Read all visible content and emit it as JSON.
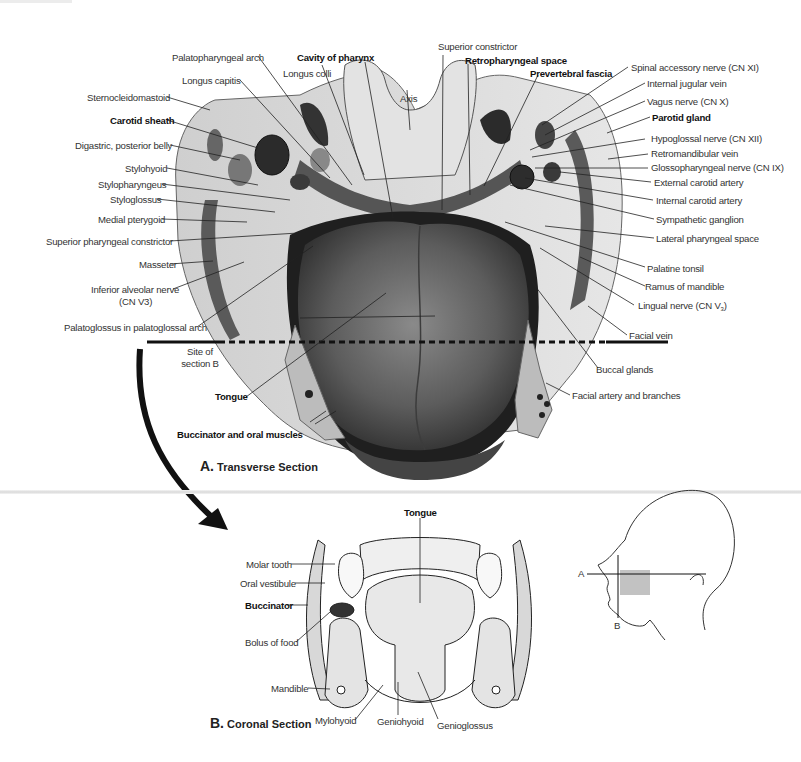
{
  "figure": {
    "section_a": {
      "caption_letter": "A.",
      "caption_text": "Transverse Section",
      "section_line_label_line1": "Site of",
      "section_line_label_line2": "section B",
      "labels_left": [
        {
          "text": "Palatopharyngeal arch",
          "bold": false
        },
        {
          "text": "Longus capitis",
          "bold": false
        },
        {
          "text": "Sternocleidomastoid",
          "bold": false
        },
        {
          "text": "Carotid sheath",
          "bold": true
        },
        {
          "text": "Digastric, posterior belly",
          "bold": false
        },
        {
          "text": "Stylohyoid",
          "bold": false
        },
        {
          "text": "Stylopharyngeus",
          "bold": false
        },
        {
          "text": "Styloglossus",
          "bold": false
        },
        {
          "text": "Medial pterygoid",
          "bold": false
        },
        {
          "text": "Superior pharyngeal constrictor",
          "bold": false
        },
        {
          "text": "Masseter",
          "bold": false
        },
        {
          "text": "Inferior alveolar nerve",
          "bold": false
        },
        {
          "text": "(CN V3)",
          "bold": false
        },
        {
          "text": "Palatoglossus in palatoglossal arch",
          "bold": false
        },
        {
          "text": "Tongue",
          "bold": true
        },
        {
          "text": "Buccinator and oral muscles",
          "bold": true
        }
      ],
      "labels_top": [
        {
          "text": "Cavity of pharynx",
          "bold": true
        },
        {
          "text": "Longus colli",
          "bold": false
        },
        {
          "text": "Axis",
          "bold": false
        },
        {
          "text": "Superior constrictor",
          "bold": false
        },
        {
          "text": "Retropharyngeal space",
          "bold": true
        },
        {
          "text": "Prevertebral fascia",
          "bold": true
        }
      ],
      "labels_right": [
        {
          "text": "Spinal accessory nerve (CN XI)",
          "bold": false
        },
        {
          "text": "Internal jugular vein",
          "bold": false
        },
        {
          "text": "Vagus nerve (CN X)",
          "bold": false
        },
        {
          "text": "Parotid gland",
          "bold": true
        },
        {
          "text": "Hypoglossal nerve (CN XII)",
          "bold": false
        },
        {
          "text": "Retromandibular vein",
          "bold": false
        },
        {
          "text": "Glossopharyngeal nerve (CN IX)",
          "bold": false
        },
        {
          "text": "External carotid artery",
          "bold": false
        },
        {
          "text": "Internal carotid artery",
          "bold": false
        },
        {
          "text": "Sympathetic ganglion",
          "bold": false
        },
        {
          "text": "Lateral pharyngeal space",
          "bold": false
        },
        {
          "text": "Palatine tonsil",
          "bold": false
        },
        {
          "text": "Ramus of mandible",
          "bold": false
        },
        {
          "text": "Lingual nerve (CN V3)",
          "bold": false
        },
        {
          "text": "Facial vein",
          "bold": false
        },
        {
          "text": "Buccal glands",
          "bold": false
        },
        {
          "text": "Facial artery and branches",
          "bold": false
        }
      ]
    },
    "section_b": {
      "caption_letter": "B.",
      "caption_text": "Coronal Section",
      "labels": [
        {
          "text": "Tongue",
          "bold": true
        },
        {
          "text": "Molar tooth",
          "bold": false
        },
        {
          "text": "Oral vestibule",
          "bold": false
        },
        {
          "text": "Buccinator",
          "bold": true
        },
        {
          "text": "Bolus of food",
          "bold": false
        },
        {
          "text": "Mandible",
          "bold": false
        },
        {
          "text": "Mylohyoid",
          "bold": false
        },
        {
          "text": "Geniohyoid",
          "bold": false
        },
        {
          "text": "Genioglossus",
          "bold": false
        }
      ]
    },
    "orientation_inset": {
      "plane_a_label": "A",
      "plane_b_label": "B"
    },
    "colors": {
      "tongue_dark": "#3a3a3a",
      "tongue_mid": "#6e6e6e",
      "tissue_light": "#d9d9d9",
      "line": "#222222",
      "label_text": "#333333"
    }
  }
}
